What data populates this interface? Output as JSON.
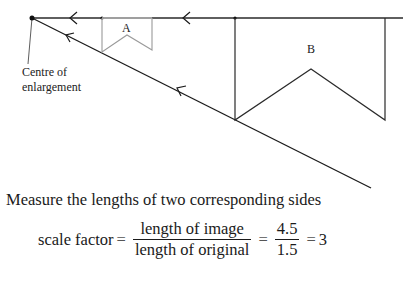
{
  "diagram": {
    "shape_a_label": "A",
    "shape_b_label": "B",
    "centre_label_line1": "Centre of",
    "centre_label_line2": "enlargement",
    "colors": {
      "ray_line": "#1a1a1a",
      "shape_a": "#9a9a9a",
      "shape_b": "#2a2a2a"
    }
  },
  "text": {
    "instruction": "Measure the lengths of two corresponding sides",
    "formula": {
      "lhs": "scale factor",
      "eq1": "=",
      "frac1_num": "length of image",
      "frac1_den": "length of original",
      "eq2": "=",
      "frac2_num": "4.5",
      "frac2_den": "1.5",
      "eq3": "=",
      "result": "3"
    }
  }
}
